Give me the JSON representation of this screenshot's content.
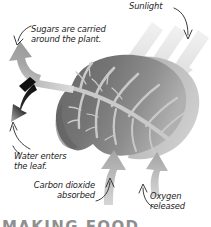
{
  "figure": {
    "background_color": "#ffffff",
    "heading_partial": "MAKING FOOD"
  },
  "labels": {
    "sugars": "Sugars are carried\naround the plant.",
    "sunlight": "Sunlight",
    "water": "Water enters\nthe leaf.",
    "carbon_dioxide": "Carbon dioxide\nabsorbed",
    "oxygen": "Oxygen\nreleased"
  },
  "colors": {
    "leaf_dark": "#6f6f6f",
    "leaf_mid": "#7d7d7d",
    "leaf_light": "#9a9a9a",
    "leaf_edge": "#b4b4b4",
    "vein": "#c9c9c9",
    "sunbeam": "#ededed",
    "arrow_gray": "#a8a8a8",
    "arrow_black": "#111111",
    "pointer": "#262626",
    "text": "#1d1d1d"
  },
  "icons": {
    "sugars_arrow": "arrow-up-curved-icon",
    "sugars_black_arrow": "arrow-down-left-black-icon",
    "sunlight_beams": "sun-beam-arrows-icon",
    "sunlight_pointer": "curved-pointer-icon",
    "water_arrow": "arrow-up-thin-icon",
    "co2_arrow": "arrow-up-thick-icon",
    "oxygen_arrow": "arrow-up-thick-icon",
    "leaf": "leaf-icon",
    "stem": "stem-icon",
    "veins": "leaf-veins-icon"
  }
}
